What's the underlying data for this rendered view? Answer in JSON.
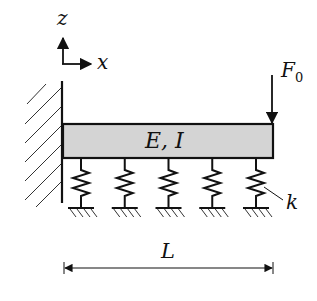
{
  "diagram": {
    "colors": {
      "line": "#111111",
      "beam_fill": "#d4d4d4",
      "background": "#ffffff"
    },
    "axes": {
      "z_label": "z",
      "x_label": "x"
    },
    "beam": {
      "label": "E, I"
    },
    "load": {
      "label": "F",
      "subscript": "0"
    },
    "spring": {
      "label": "k",
      "count": 5
    },
    "dimension": {
      "label": "L"
    }
  }
}
